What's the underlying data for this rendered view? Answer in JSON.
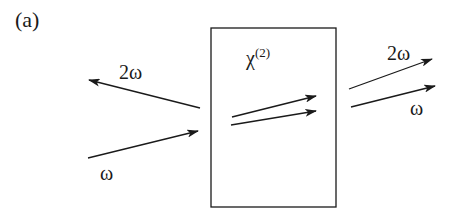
{
  "panel_label": "(a)",
  "crystal": {
    "label": "χ",
    "superscript": "(2)"
  },
  "labels": {
    "incident_reflected_2w": "2ω",
    "incident_w": "ω",
    "output_2w": "2ω",
    "output_w": "ω"
  },
  "colors": {
    "stroke": "#1a1a1a",
    "background": "#ffffff"
  }
}
